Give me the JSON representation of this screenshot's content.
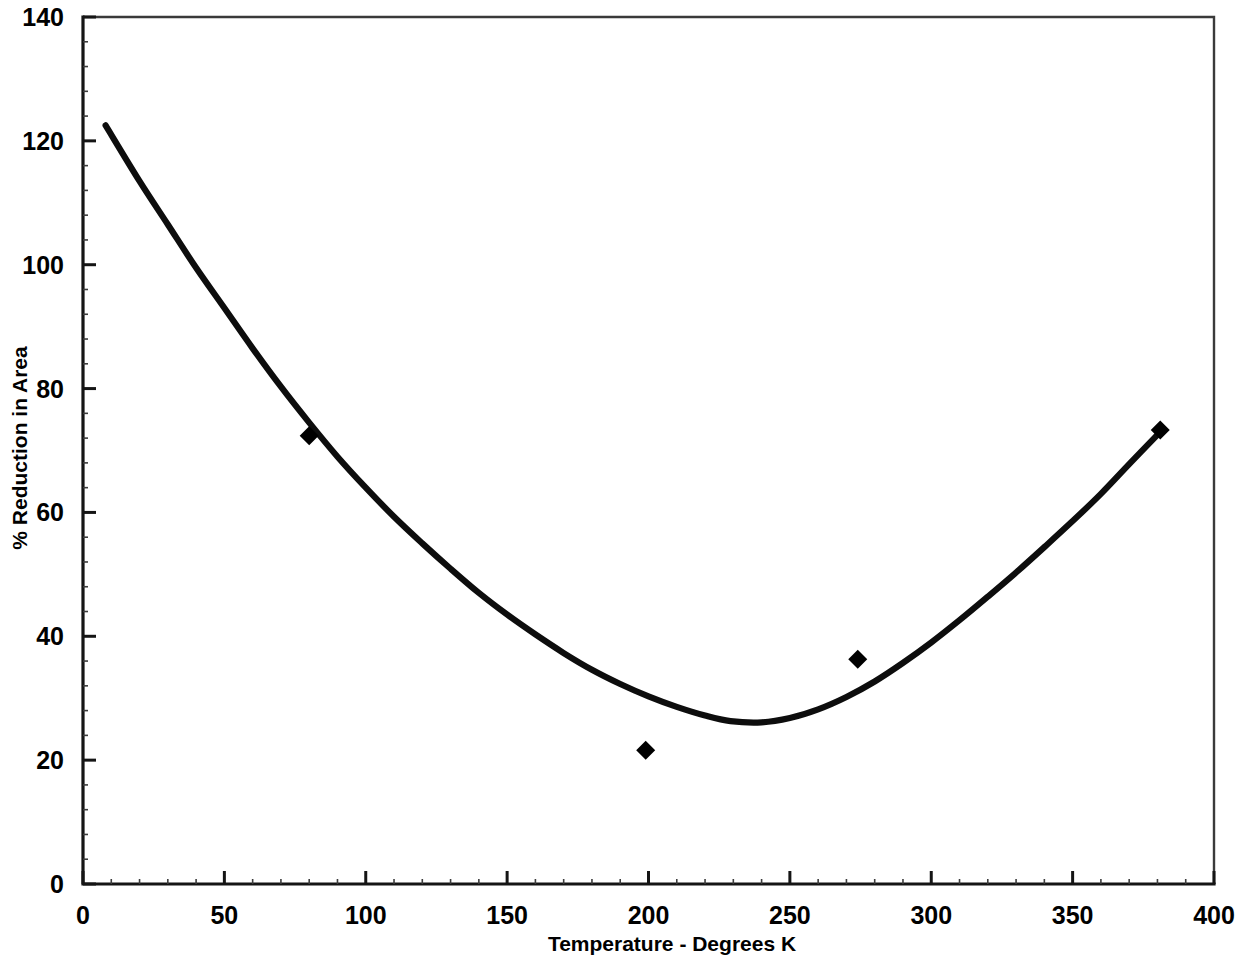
{
  "chart_data": {
    "type": "line",
    "title": "",
    "xlabel": "Temperature - Degrees K",
    "ylabel": "% Reduction in Area",
    "xlim": [
      0,
      400
    ],
    "ylim": [
      0,
      140
    ],
    "grid": false,
    "legend": "none",
    "x_ticks": [
      0,
      50,
      100,
      150,
      200,
      250,
      300,
      350,
      400
    ],
    "x_tick_labels": [
      "0",
      "50",
      "100",
      "150",
      "200",
      "250",
      "300",
      "350",
      "400"
    ],
    "y_ticks": [
      0,
      20,
      40,
      60,
      80,
      100,
      120,
      140
    ],
    "y_tick_labels": [
      "0",
      "20",
      "40",
      "60",
      "80",
      "100",
      "120",
      "140"
    ],
    "series": [
      {
        "name": "fitted curve",
        "style": "line",
        "color": "#000000",
        "points": [
          [
            8,
            122.5
          ],
          [
            20,
            113.5
          ],
          [
            30,
            106.5
          ],
          [
            40,
            99.5
          ],
          [
            50,
            93.0
          ],
          [
            60,
            86.5
          ],
          [
            70,
            80.3
          ],
          [
            80,
            74.5
          ],
          [
            90,
            69.0
          ],
          [
            100,
            64.0
          ],
          [
            110,
            59.3
          ],
          [
            120,
            55.0
          ],
          [
            130,
            50.9
          ],
          [
            140,
            47.0
          ],
          [
            150,
            43.5
          ],
          [
            160,
            40.3
          ],
          [
            170,
            37.3
          ],
          [
            180,
            34.6
          ],
          [
            190,
            32.3
          ],
          [
            200,
            30.3
          ],
          [
            210,
            28.6
          ],
          [
            220,
            27.2
          ],
          [
            229,
            26.3
          ],
          [
            240,
            26.1
          ],
          [
            250,
            26.8
          ],
          [
            260,
            28.2
          ],
          [
            270,
            30.2
          ],
          [
            280,
            32.7
          ],
          [
            290,
            35.7
          ],
          [
            300,
            39.0
          ],
          [
            310,
            42.6
          ],
          [
            320,
            46.4
          ],
          [
            330,
            50.3
          ],
          [
            340,
            54.4
          ],
          [
            350,
            58.6
          ],
          [
            360,
            63.0
          ],
          [
            370,
            67.8
          ],
          [
            381,
            73.0
          ]
        ]
      },
      {
        "name": "measured data",
        "style": "markers",
        "marker": "diamond",
        "color": "#000000",
        "points": [
          [
            80,
            72.4
          ],
          [
            199,
            21.6
          ],
          [
            274,
            36.3
          ],
          [
            381,
            73.3
          ]
        ]
      }
    ]
  },
  "axes": {
    "x_title": "Temperature - Degrees K",
    "y_title": "% Reduction in Area"
  }
}
